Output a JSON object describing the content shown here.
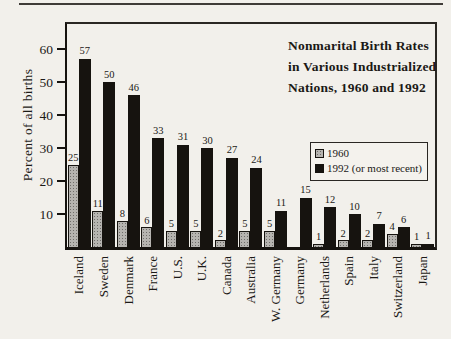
{
  "page": {
    "title_lines": [
      "Nonmarital Birth Rates",
      "in Various Industrialized",
      "Nations, 1960 and 1992"
    ]
  },
  "colors": {
    "paper": "#f2f0eb",
    "bar_1960_fill": "#b6b4b0",
    "bar_1960_dots": "#6f6d6a",
    "bar_1992_fill": "#16130f",
    "text": "#1b1916"
  },
  "chart_data": {
    "type": "bar",
    "title": "Nonmarital Birth Rates in Various Industrialized Nations, 1960 and 1992",
    "xlabel": "",
    "ylabel": "Percent of all births",
    "ylim": [
      0,
      66
    ],
    "yticks": [
      10,
      20,
      30,
      40,
      50,
      60
    ],
    "grid": false,
    "legend_position": "middle-right",
    "bar_value_labels_shown": true,
    "categories": [
      "Iceland",
      "Sweden",
      "Denmark",
      "France",
      "U.S.",
      "U.K.",
      "Canada",
      "Australia",
      "W. Germany",
      "Germany",
      "Netherlands",
      "Spain",
      "Italy",
      "Switzerland",
      "Japan"
    ],
    "series": [
      {
        "name": "1960",
        "values": [
          25,
          11,
          8,
          6,
          5,
          5,
          2,
          5,
          5,
          null,
          1,
          2,
          2,
          4,
          1
        ]
      },
      {
        "name": "1992 (or most recent)",
        "values": [
          57,
          50,
          46,
          33,
          31,
          30,
          27,
          24,
          11,
          15,
          12,
          10,
          7,
          6,
          1
        ]
      }
    ]
  }
}
